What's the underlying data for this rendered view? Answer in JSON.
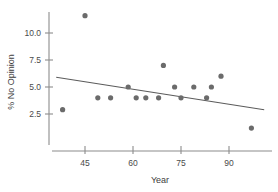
{
  "chart_data": {
    "type": "scatter",
    "title": "",
    "subtitle": "",
    "xlabel": "Year",
    "ylabel": "% No Opinion",
    "xlim": [
      34,
      101
    ],
    "ylim": [
      0.4,
      12.2
    ],
    "grid": false,
    "legend": null,
    "x_ticks": [
      45,
      60,
      75,
      90
    ],
    "x_tick_labels": [
      "45",
      "60",
      "75",
      "90"
    ],
    "y_ticks": [
      2.5,
      5.0,
      7.5,
      10.0
    ],
    "y_tick_labels": [
      "2.5",
      "5.0",
      "7.5",
      "10.0"
    ],
    "point_color": "#6b6b6b",
    "line_color": "#5b5b5b",
    "axis_color": "#8c8c8c",
    "points": [
      {
        "x": 38.0,
        "y": 2.9
      },
      {
        "x": 45.0,
        "y": 11.6
      },
      {
        "x": 49.0,
        "y": 4.0
      },
      {
        "x": 53.0,
        "y": 4.0
      },
      {
        "x": 58.5,
        "y": 5.0
      },
      {
        "x": 61.0,
        "y": 4.0
      },
      {
        "x": 64.0,
        "y": 4.0
      },
      {
        "x": 68.0,
        "y": 4.0
      },
      {
        "x": 69.5,
        "y": 7.0
      },
      {
        "x": 73.0,
        "y": 5.0
      },
      {
        "x": 75.0,
        "y": 4.0
      },
      {
        "x": 79.0,
        "y": 5.0
      },
      {
        "x": 83.0,
        "y": 4.0
      },
      {
        "x": 84.5,
        "y": 5.0
      },
      {
        "x": 87.5,
        "y": 6.0
      },
      {
        "x": 97.0,
        "y": 1.2
      }
    ],
    "trend_line": {
      "x_start": 36.0,
      "y_start": 5.9,
      "x_end": 101.0,
      "y_end": 2.9
    }
  }
}
